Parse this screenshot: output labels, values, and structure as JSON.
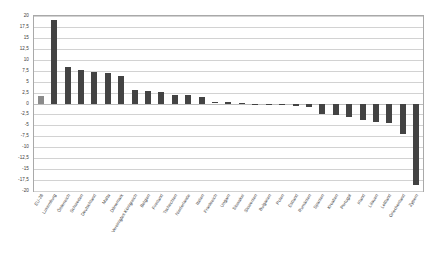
{
  "chart_data": {
    "type": "bar",
    "title": "",
    "subtitle": "",
    "xlabel": "",
    "ylabel": "",
    "ylim": [
      -20,
      20
    ],
    "grid": true,
    "legend": false,
    "legend_position": "none",
    "orientation": "vertical",
    "bar_color": "#434343",
    "highlight_color": "#8a8a8a",
    "highlight_index": 0,
    "y_ticks": [
      "20",
      "17,5",
      "15",
      "12,5",
      "10",
      "7,5",
      "5",
      "2,5",
      "0",
      "-2,5",
      "-5",
      "-7,5",
      "-10",
      "-12,5",
      "-15",
      "-17,5",
      "-20"
    ],
    "y_tick_values": [
      20,
      17.5,
      15,
      12.5,
      10,
      7.5,
      5,
      2.5,
      0,
      -2.5,
      -5,
      -7.5,
      -10,
      -12.5,
      -15,
      -17.5,
      -20
    ],
    "categories": [
      "EU-28",
      "Luxemburg",
      "Österreich",
      "Schweden",
      "Deutschland",
      "Malta",
      "Dänemark",
      "Vereinigtes Königreich",
      "Belgien",
      "Finnland",
      "Tschechien",
      "Niederlande",
      "Italien",
      "Frankreich",
      "Ungarn",
      "Slowakei",
      "Slowenien",
      "Bulgarien",
      "Polen",
      "Estland",
      "Rumänien",
      "Spanien",
      "Kroatien",
      "Portugal",
      "Irland",
      "Litauen",
      "Lettland",
      "Griechenland",
      "Zypern"
    ],
    "values": [
      1.7,
      19.0,
      8.3,
      7.7,
      7.1,
      6.9,
      6.2,
      3.2,
      2.9,
      2.7,
      1.9,
      1.9,
      1.5,
      0.4,
      0.3,
      0.2,
      -0.2,
      -0.3,
      -0.4,
      -0.6,
      -0.9,
      -2.4,
      -2.6,
      -3.1,
      -3.7,
      -4.3,
      -4.5,
      -6.9,
      -18.6
    ]
  }
}
